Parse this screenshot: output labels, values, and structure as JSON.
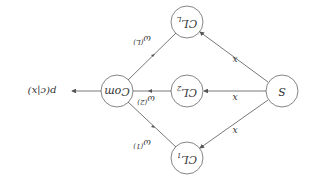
{
  "nodes": {
    "source": {
      "label": "S"
    },
    "classifiers": [
      {
        "label": "CL",
        "sub": "1"
      },
      {
        "label": "CL",
        "sub": "2"
      },
      {
        "label": "CL",
        "sub": "L"
      }
    ],
    "combiner": {
      "label": "Com"
    }
  },
  "edges": {
    "input_label": "x",
    "weights": [
      {
        "base": "ω",
        "sup": "(1)"
      },
      {
        "base": "ω",
        "sup": "(2)"
      },
      {
        "base": "ω",
        "sup": "(L)"
      }
    ],
    "output_label": "p(c|x)"
  },
  "colors": {
    "stroke": "#555555",
    "text": "#333333",
    "background": "#ffffff"
  }
}
